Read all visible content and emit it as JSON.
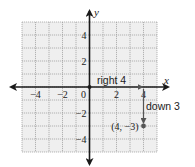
{
  "diagram": {
    "type": "coordinate-plane-translation",
    "grid": {
      "xmin": -5,
      "xmax": 5,
      "ymin": -5,
      "ymax": 5,
      "step": 1
    },
    "axes": {
      "x_label": "x",
      "y_label": "y"
    },
    "x_ticks": [
      {
        "value": -4,
        "label": "−4"
      },
      {
        "value": -2,
        "label": "−2"
      },
      {
        "value": 0,
        "label": "0"
      },
      {
        "value": 2,
        "label": "2"
      },
      {
        "value": 4,
        "label": "4"
      }
    ],
    "y_ticks": [
      {
        "value": 4,
        "label": "4"
      },
      {
        "value": 2,
        "label": "2"
      },
      {
        "value": -2,
        "label": "−2"
      },
      {
        "value": -4,
        "label": "−4"
      }
    ],
    "annotations": {
      "right": "right 4",
      "down": "down 3"
    },
    "point": {
      "x": 4,
      "y": -3,
      "label": "(4, −3)"
    },
    "colors": {
      "grid_fill": "#efefef",
      "grid_line": "#9a9a9a",
      "axis": "#1a1a1a",
      "path": "#555555",
      "point": "#555555",
      "text": "#222222"
    }
  }
}
